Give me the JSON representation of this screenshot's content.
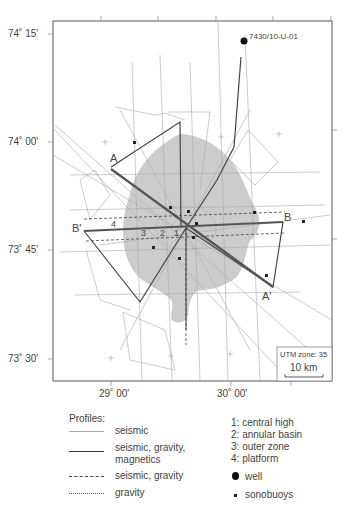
{
  "map": {
    "lat_labels": [
      "74˚ 15'",
      "74˚ 00'",
      "73˚ 45'",
      "73˚ 30'"
    ],
    "lon_labels": [
      "29˚ 00'",
      "30˚ 00'"
    ],
    "well_label": "7430/10-U-01",
    "profile_labels": {
      "a": "A",
      "a_prime": "A'",
      "b": "B",
      "b_prime": "B'"
    },
    "zone_numbers": [
      "1",
      "2",
      "3",
      "4"
    ],
    "utm_zone": "UTM zone: 35",
    "scale_bar": "10 km"
  },
  "legend": {
    "profiles_title": "Profiles:",
    "profiles": [
      {
        "style": "thin-solid",
        "label": "seismic"
      },
      {
        "style": "thick-solid",
        "label": "seismic, gravity,\nmagnetics"
      },
      {
        "style": "dashed",
        "label": "seismic, gravity"
      },
      {
        "style": "dotted",
        "label": "gravity"
      }
    ],
    "zones": [
      {
        "num": "1:",
        "label": "central high"
      },
      {
        "num": "2:",
        "label": "annular basin"
      },
      {
        "num": "3:",
        "label": "outer zone"
      },
      {
        "num": "4:",
        "label": "platform"
      }
    ],
    "symbols": [
      {
        "icon": "well-dot-icon",
        "label": "well"
      },
      {
        "icon": "sonobuoy-square-icon",
        "label": "sonobuoys"
      }
    ]
  },
  "colors": {
    "impact_area": "#cccccc",
    "thin_line": "#aaaaaa",
    "thick_line": "#444444",
    "frame": "#555555"
  }
}
